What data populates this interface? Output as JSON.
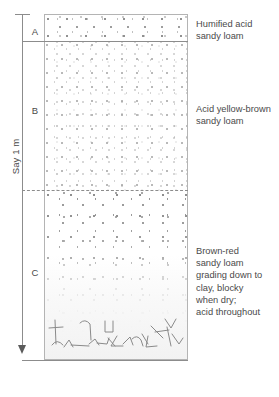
{
  "figure": {
    "type": "soil-profile"
  },
  "scale": {
    "label": "Say 1 m",
    "tick_icon": "scale-tick",
    "arrow_icon": "down-arrow-icon"
  },
  "horizons": [
    {
      "letter": "A",
      "name": "A horizon",
      "boundary_style": "solid",
      "description_lines": [
        "Humified acid",
        "sandy loam"
      ]
    },
    {
      "letter": "B",
      "name": "B horizon",
      "boundary_style": "dashed",
      "description_lines": [
        "Acid yellow-brown",
        "sandy loam"
      ]
    },
    {
      "letter": "C",
      "name": "C horizon",
      "boundary_style": "solid",
      "description_lines": [
        "Brown-red",
        "sandy loam",
        "grading down to",
        "clay, blocky",
        "when dry;",
        "acid throughout"
      ]
    }
  ],
  "colors": {
    "line": "#8c8c8c",
    "border": "#b4b4b4",
    "text": "#4a4a4a",
    "stipple": "#9a9a9a",
    "background": "#ffffff"
  }
}
